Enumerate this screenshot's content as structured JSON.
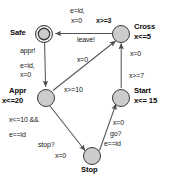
{
  "diagram": {
    "colors": {
      "node_fill": "#cccccc",
      "node_stroke": "#3b3b3b",
      "edge_stroke": "#555555",
      "text": "#0a0a0a",
      "background": "#ffffff"
    },
    "nodes": [
      {
        "id": "safe",
        "label": "Safe",
        "invariant": "",
        "accepting": true,
        "cx": 44,
        "cy": 33,
        "r": 8.5
      },
      {
        "id": "cross",
        "label": "Cross",
        "invariant": "x<=5",
        "accepting": false,
        "cx": 121,
        "cy": 33,
        "r": 8.5
      },
      {
        "id": "appr",
        "label": "Appr",
        "invariant": "x<=20",
        "accepting": false,
        "cx": 46,
        "cy": 97,
        "r": 8.5
      },
      {
        "id": "start",
        "label": "Start",
        "invariant": "x<= 15",
        "accepting": false,
        "cx": 121,
        "cy": 97,
        "r": 8.5
      },
      {
        "id": "stop",
        "label": "Stop",
        "invariant": "",
        "accepting": false,
        "cx": 92,
        "cy": 157,
        "r": 8.5
      }
    ],
    "node_text": {
      "safe_name": "Safe",
      "cross_name": "Cross",
      "cross_inv": "x<=5",
      "appr_name": "Appr",
      "appr_inv": "x<=20",
      "start_name": "Start",
      "start_inv": "x<= 15",
      "stop_name": "Stop"
    },
    "edges": [
      {
        "id": "cross-to-safe",
        "from": "cross",
        "to": "safe",
        "guard": "x>=3",
        "sync": "leave!",
        "assign_1": "e=id,",
        "assign_2": "x=0"
      },
      {
        "id": "safe-to-appr",
        "from": "safe",
        "to": "appr",
        "sync": "appr!",
        "assign_1": "e=id,",
        "assign_2": "x=0"
      },
      {
        "id": "appr-to-cross",
        "from": "appr",
        "to": "cross",
        "guard": "x>=10",
        "assign_1": "x=0"
      },
      {
        "id": "start-to-cross",
        "from": "start",
        "to": "cross",
        "guard": "x>=7",
        "assign_1": "x=0"
      },
      {
        "id": "appr-to-stop",
        "from": "appr",
        "to": "stop",
        "guard_1": "x<=10 &&",
        "guard_2": "e==id",
        "sync": "stop?",
        "assign_1": "x=0"
      },
      {
        "id": "stop-to-start",
        "from": "stop",
        "to": "start",
        "guard": "e==id",
        "sync": "go?",
        "assign_1": "x=0"
      }
    ],
    "edge_text": {
      "cross_safe_assign_1": "e=id,",
      "cross_safe_assign_2": "x=0",
      "cross_safe_guard": "x>=3",
      "cross_safe_sync": "leave!",
      "safe_appr_sync": "appr!",
      "safe_appr_assign_1": "e=id,",
      "safe_appr_assign_2": "x=0",
      "appr_cross_assign": "x=0",
      "appr_cross_guard": "x>=10",
      "start_cross_assign": "x=0",
      "start_cross_guard": "x>=7",
      "appr_stop_guard_1": "x<=10 &&",
      "appr_stop_guard_2": "e==id",
      "appr_stop_sync": "stop?",
      "appr_stop_assign": "x=0",
      "stop_start_assign": "x=0",
      "stop_start_sync": "go?",
      "stop_start_guard": "e==id"
    }
  }
}
